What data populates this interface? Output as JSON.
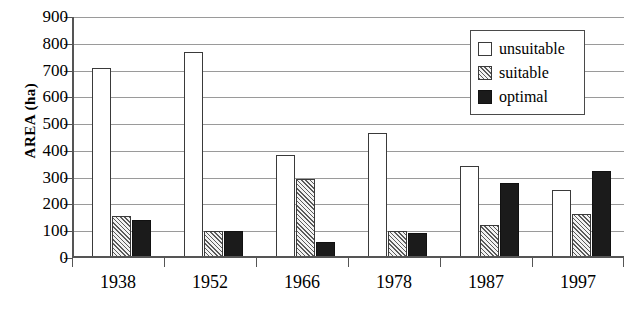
{
  "chart_data": {
    "type": "bar",
    "title": "",
    "xlabel": "",
    "ylabel": "AREA (ha)",
    "ylim": [
      0,
      900
    ],
    "ytick_step": 100,
    "yticks": [
      0,
      100,
      200,
      300,
      400,
      500,
      600,
      700,
      800,
      900
    ],
    "grid": true,
    "legend_position": "top-right",
    "categories": [
      "1938",
      "1952",
      "1966",
      "1978",
      "1987",
      "1997"
    ],
    "series": [
      {
        "name": "unsuitable",
        "color": "#ffffff",
        "fill": "solid-white",
        "values": [
          710,
          770,
          385,
          465,
          345,
          255
        ]
      },
      {
        "name": "suitable",
        "color": "#808080",
        "fill": "hatched",
        "values": [
          158,
          100,
          295,
          100,
          125,
          165
        ]
      },
      {
        "name": "optimal",
        "color": "#1b1b1b",
        "fill": "solid-black",
        "values": [
          143,
          100,
          60,
          95,
          280,
          325
        ]
      }
    ]
  },
  "legend": {
    "items": [
      {
        "label": "unsuitable",
        "swatch": "white-square"
      },
      {
        "label": "suitable",
        "swatch": "hatched-square"
      },
      {
        "label": "optimal",
        "swatch": "black-square"
      }
    ]
  }
}
